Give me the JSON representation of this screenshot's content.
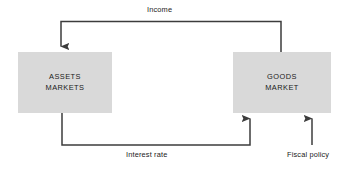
{
  "diagram": {
    "background_color": "#ffffff",
    "line_color": "#3c3c3c",
    "node_fill_color": "#d9d9d9",
    "text_color": "#1a1a1a",
    "nodes": [
      {
        "id": "assets-markets",
        "label": "ASSETS\nMARKETS",
        "line1": "ASSETS",
        "line2": "MARKETS"
      },
      {
        "id": "goods-market",
        "label": "GOODS\nMARKET",
        "line1": "GOODS",
        "line2": "MARKET"
      }
    ],
    "edges": [
      {
        "id": "income",
        "label": "Income",
        "from": "goods-market",
        "to": "assets-markets",
        "direction": "right-to-left",
        "arrowhead": "down-into-assets-markets"
      },
      {
        "id": "interest-rate",
        "label": "Interest rate",
        "from": "assets-markets",
        "to": "goods-market",
        "direction": "left-to-right",
        "arrowhead": "up-into-goods-market"
      },
      {
        "id": "fiscal-policy",
        "label": "Fiscal policy",
        "from": "external",
        "to": "goods-market",
        "direction": "upward",
        "arrowhead": "up-into-goods-market"
      }
    ]
  }
}
